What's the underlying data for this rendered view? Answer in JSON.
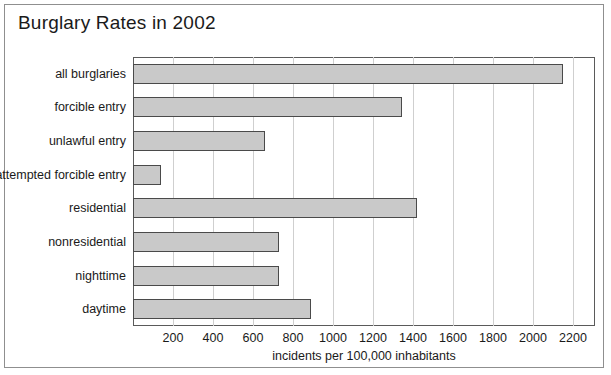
{
  "chart_data": {
    "type": "bar",
    "orientation": "horizontal",
    "title": "Burglary Rates in 2002",
    "xlabel": "incidents per 100,000 inhabitants",
    "ylabel": "",
    "categories": [
      "all burglaries",
      "forcible entry",
      "unlawful entry",
      "attempted forcible entry",
      "residential",
      "nonresidential",
      "nighttime",
      "daytime"
    ],
    "values": [
      2150,
      1345,
      660,
      140,
      1420,
      730,
      730,
      890
    ],
    "xlim": [
      0,
      2310
    ],
    "xticks": [
      200,
      400,
      600,
      800,
      1000,
      1200,
      1400,
      1600,
      1800,
      2000,
      2200
    ],
    "xtick_labels": [
      "200",
      "400",
      "600",
      "800",
      "1000",
      "1200",
      "1400",
      "1600",
      "1800",
      "2000",
      "2200"
    ],
    "grid": "vertical",
    "legend": "none",
    "colors": {
      "bar_fill": "#c9c9c9",
      "bar_edge": "#4a4a4a",
      "gridline": "#cfcfcf",
      "axis": "#5a5a5a",
      "frame": "#8f8f8f",
      "text": "#1a1a1a",
      "background": "#ffffff"
    }
  }
}
